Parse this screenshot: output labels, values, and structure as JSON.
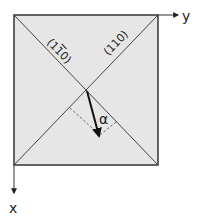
{
  "diagram": {
    "axes": {
      "y_label": "y",
      "x_label": "x"
    },
    "planes": {
      "left_diagonal_label": "(1̅0)",
      "left_diagonal_label_digits": [
        "1",
        "1",
        "0"
      ],
      "left_diagonal_bar_over_index": 1,
      "right_diagonal_label": "(110)"
    },
    "angle_label": "α",
    "colors": {
      "square_fill": "#e6e6e6",
      "lines": "#333333",
      "arrow": "#111111",
      "dashed": "#555555"
    }
  }
}
